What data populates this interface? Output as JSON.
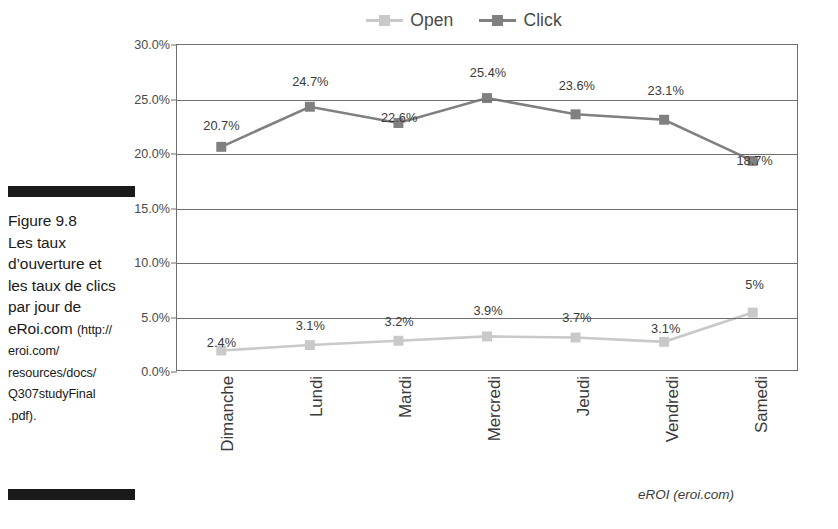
{
  "figure": {
    "caption_lines": [
      {
        "text": "Figure 9.8",
        "small": false
      },
      {
        "text": "Les taux",
        "small": false
      },
      {
        "text": "d’ouverture et",
        "small": false
      },
      {
        "text": "les taux de clics",
        "small": false
      },
      {
        "text": "par jour de",
        "small": false
      }
    ],
    "caption_line_eroi_main": "eRoi.com ",
    "caption_line_eroi_url": "(http://",
    "caption_small_lines": [
      "eroi.com/",
      "resources/docs/",
      "Q307studyFinal",
      ".pdf)."
    ],
    "source_note": "eROI (eroi.com)"
  },
  "legend": {
    "items": [
      {
        "label": "Open",
        "color": "#c9c9c9"
      },
      {
        "label": "Click",
        "color": "#808080"
      }
    ]
  },
  "chart_data": {
    "type": "line",
    "title": "",
    "xlabel": "",
    "ylabel": "",
    "ylim": [
      0,
      30
    ],
    "ytick_labels": [
      "30.0%",
      "25.0%",
      "20.0%",
      "15.0%",
      "10.0%",
      "5.0%",
      "0.0%"
    ],
    "ytick_values": [
      30,
      25,
      20,
      15,
      10,
      5,
      0
    ],
    "grid": true,
    "legend_position": "top-center",
    "categories": [
      "Dimanche",
      "Lundi",
      "Mardi",
      "Mercredi",
      "Jeudi",
      "Vendredi",
      "Samedi"
    ],
    "series": [
      {
        "name": "Open",
        "color": "#c9c9c9",
        "values": [
          2.4,
          3.1,
          3.2,
          3.9,
          3.7,
          3.1,
          5.0
        ],
        "plotted": [
          1.8,
          2.3,
          2.7,
          3.1,
          3.0,
          2.6,
          5.3
        ],
        "labels": [
          "2.4%",
          "3.1%",
          "3.2%",
          "3.9%",
          "3.7%",
          "3.1%",
          "5%"
        ]
      },
      {
        "name": "Click",
        "color": "#808080",
        "values": [
          20.7,
          24.7,
          22.6,
          25.4,
          23.6,
          23.1,
          18.7
        ],
        "plotted": [
          20.6,
          24.3,
          22.8,
          25.1,
          23.6,
          23.1,
          19.3
        ],
        "labels": [
          "20.7%",
          "24.7%",
          "22.6%",
          "25.4%",
          "23.6%",
          "23.1%",
          "18.7%"
        ]
      }
    ]
  }
}
